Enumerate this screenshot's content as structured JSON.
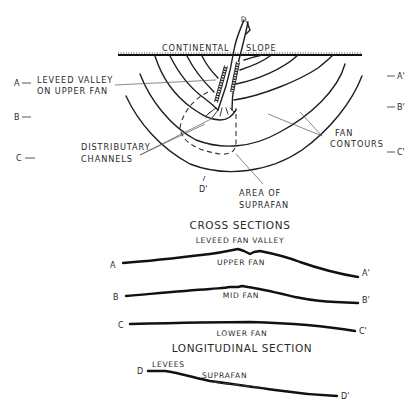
{
  "plan_view": {
    "top_label_left": "CONTINENTAL",
    "top_label_right": "SLOPE",
    "canyon_label": "D",
    "leveed_valley_line1": "LEVEED VALLEY",
    "leveed_valley_line2": "ON UPPER FAN",
    "distributary_line1": "DISTRIBUTARY",
    "distributary_line2": "CHANNELS",
    "fan_contours_line1": "FAN",
    "fan_contours_line2": "CONTOURS",
    "suprafan_line1": "AREA OF",
    "suprafan_line2": "SUPRAFAN",
    "d_prime": "D'",
    "section_keys_left": [
      "A",
      "B",
      "C"
    ],
    "section_keys_right": [
      "A'",
      "B'",
      "C'"
    ]
  },
  "cross_sections": {
    "title": "CROSS SECTIONS",
    "subtitle": "LEVEED FAN VALLEY",
    "rows": [
      {
        "start": "A",
        "end": "A'",
        "label": "UPPER FAN"
      },
      {
        "start": "B",
        "end": "B'",
        "label": "MID FAN"
      },
      {
        "start": "C",
        "end": "C'",
        "label": "LOWER FAN"
      }
    ]
  },
  "longitudinal_section": {
    "title": "LONGITUDINAL SECTION",
    "start": "D",
    "end": "D'",
    "levees_label": "LEVEES",
    "suprafan_label": "SUPRAFAN"
  }
}
